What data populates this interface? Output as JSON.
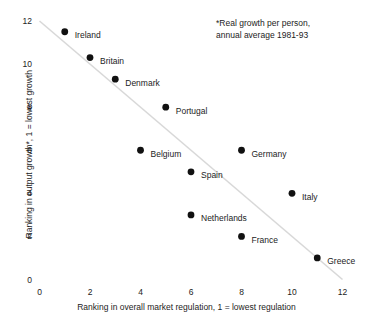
{
  "chart_data": {
    "type": "scatter",
    "title": "",
    "xlabel": "Ranking in overall market regulation, 1 =  lowest regulation",
    "ylabel": "Ranking in output growth*, 1 = lowest growth",
    "xlim": [
      0,
      12
    ],
    "ylim": [
      0,
      12
    ],
    "xticks": [
      "0",
      "2",
      "4",
      "6",
      "8",
      "10",
      "12"
    ],
    "yticks": [
      "0",
      "2",
      "4",
      "6",
      "8",
      "10",
      "12"
    ],
    "xtick_values": [
      0,
      2,
      4,
      6,
      8,
      10,
      12
    ],
    "ytick_values": [
      0,
      2,
      4,
      6,
      8,
      10,
      12
    ],
    "grid": false,
    "legend": null,
    "annotations": [
      {
        "name": "footnote",
        "line1": "*Real growth per person,",
        "line2": "annual average 1981-93"
      }
    ],
    "trendline": {
      "name": "fit-line",
      "x": [
        0,
        12
      ],
      "y": [
        12,
        0
      ],
      "color": "#d8d8d8",
      "style": "solid"
    },
    "marker_color": "#111111",
    "points": [
      {
        "label": "Ireland",
        "x": 1,
        "y": 11.5
      },
      {
        "label": "Britain",
        "x": 2,
        "y": 10.3
      },
      {
        "label": "Denmark",
        "x": 3,
        "y": 9.3
      },
      {
        "label": "Portugal",
        "x": 5,
        "y": 8
      },
      {
        "label": "Belgium",
        "x": 4,
        "y": 6
      },
      {
        "label": "Germany",
        "x": 8,
        "y": 6
      },
      {
        "label": "Spain",
        "x": 6,
        "y": 5
      },
      {
        "label": "Italy",
        "x": 10,
        "y": 4
      },
      {
        "label": "Netherlands",
        "x": 6,
        "y": 3
      },
      {
        "label": "France",
        "x": 8,
        "y": 2
      },
      {
        "label": "Greece",
        "x": 11,
        "y": 1
      }
    ]
  }
}
